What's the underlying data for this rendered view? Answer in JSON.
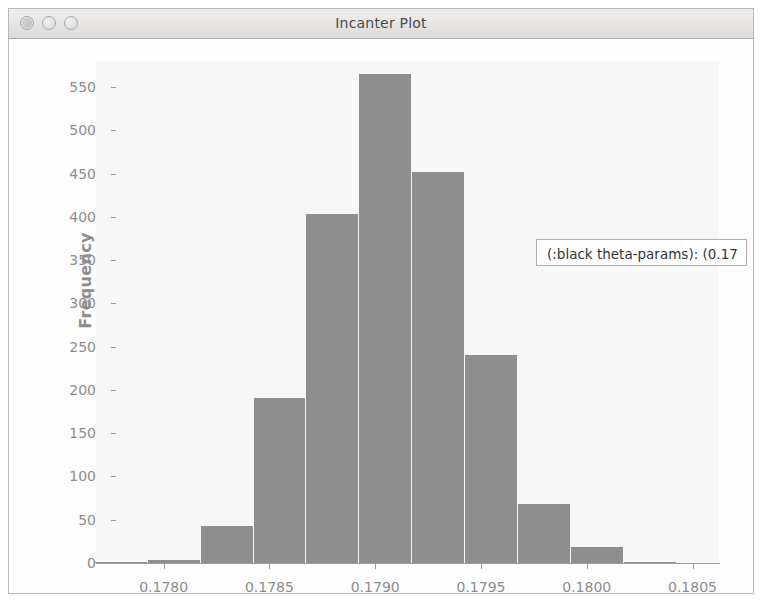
{
  "window": {
    "title": "Incanter Plot",
    "buttons": [
      {
        "name": "close",
        "label": ""
      },
      {
        "name": "minimize",
        "label": ""
      },
      {
        "name": "zoom",
        "label": ""
      }
    ]
  },
  "tooltip": {
    "text": "(:black theta-params): (0.17",
    "truncated": true
  },
  "chart_data": {
    "type": "bar",
    "title": "",
    "xlabel": "(:black theta-params)",
    "ylabel": "Frequency",
    "xlim": [
      0.17768,
      0.18063
    ],
    "ylim": [
      0,
      580
    ],
    "grid": false,
    "legend": null,
    "bin_width": 0.00025,
    "x_ticks": [
      "0.1780",
      "0.1785",
      "0.1790",
      "0.1795",
      "0.1800",
      "0.1805"
    ],
    "x_tick_values": [
      0.178,
      0.1785,
      0.179,
      0.1795,
      0.18,
      0.1805
    ],
    "y_ticks": [
      "0",
      "50",
      "100",
      "150",
      "200",
      "250",
      "300",
      "350",
      "400",
      "450",
      "500",
      "550"
    ],
    "y_tick_values": [
      0,
      50,
      100,
      150,
      200,
      250,
      300,
      350,
      400,
      450,
      500,
      550
    ],
    "bin_edges": [
      0.177675,
      0.177925,
      0.178175,
      0.178425,
      0.178675,
      0.178925,
      0.179175,
      0.179425,
      0.179675,
      0.179925,
      0.180175,
      0.180425
    ],
    "values": [
      1,
      4,
      43,
      191,
      403,
      565,
      452,
      240,
      68,
      18,
      1
    ],
    "bar_color": "#8e8e8e",
    "plot_bg": "#f7f7f7"
  }
}
